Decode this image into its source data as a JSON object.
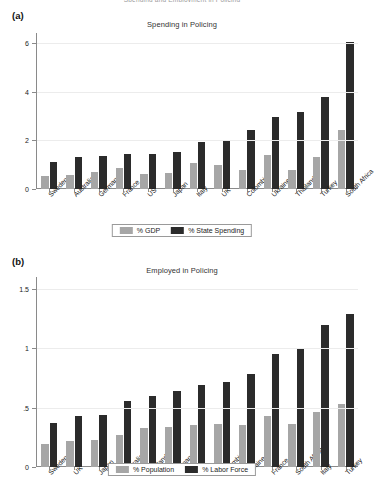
{
  "running_title": "Spending and Employment in Policing",
  "panels": [
    {
      "letter": "(a)",
      "title": "Spending in Policing",
      "legend": [
        {
          "label": "% GDP",
          "style": "light"
        },
        {
          "label": "% State Spending",
          "style": "dark"
        }
      ]
    },
    {
      "letter": "(b)",
      "title": "Employed in Policing",
      "legend": [
        {
          "label": "% Population",
          "style": "light"
        },
        {
          "label": "% Labor Force",
          "style": "dark"
        }
      ]
    }
  ],
  "colors": {
    "light_bar": "#a6a6a6",
    "dark_bar": "#2b2b2b",
    "axis": "#8a8a8a",
    "grid": "#ececec"
  },
  "chart_data": [
    {
      "type": "bar",
      "panel": "(a)",
      "title": "Spending in Policing",
      "xlabel": "",
      "ylabel": "",
      "ylim": [
        0,
        6.4
      ],
      "yticks": [
        0,
        2,
        4,
        6
      ],
      "ytick_labels": [
        "0",
        "2",
        "4",
        "6"
      ],
      "grid": true,
      "legend_position": "bottom",
      "categories": [
        "Sweden",
        "Australia",
        "Germany",
        "France",
        "US",
        "Japan",
        "Italy",
        "UK",
        "Colombia",
        "Ukraine",
        "Thailand",
        "Turkey",
        "South Africa"
      ],
      "series": [
        {
          "name": "% GDP",
          "values": [
            0.55,
            0.56,
            0.68,
            0.87,
            0.62,
            0.67,
            1.08,
            0.98,
            0.78,
            1.39,
            0.77,
            1.3,
            2.42
          ]
        },
        {
          "name": "% State Spending",
          "values": [
            1.11,
            1.32,
            1.37,
            1.43,
            1.44,
            1.5,
            1.93,
            2.0,
            2.42,
            2.97,
            3.17,
            3.79,
            6.02
          ]
        }
      ]
    },
    {
      "type": "bar",
      "panel": "(b)",
      "title": "Employed in Policing",
      "xlabel": "",
      "ylabel": "",
      "ylim": [
        0,
        1.6
      ],
      "yticks": [
        0,
        0.5,
        1,
        1.5
      ],
      "ytick_labels": [
        "0",
        ".5",
        "1",
        "1.5"
      ],
      "grid": true,
      "legend_position": "bottom",
      "categories": [
        "Sweden",
        "UK",
        "Japan",
        "Australia",
        "Thailand",
        "Germany",
        "US",
        "Colombia",
        "Ukraine",
        "France",
        "South Africa",
        "Italy",
        "Turkey"
      ],
      "series": [
        {
          "name": "% Population",
          "values": [
            0.19,
            0.22,
            0.23,
            0.27,
            0.33,
            0.34,
            0.35,
            0.36,
            0.355,
            0.43,
            0.36,
            0.46,
            0.53
          ]
        },
        {
          "name": "% Labor Force",
          "values": [
            0.37,
            0.43,
            0.44,
            0.56,
            0.6,
            0.64,
            0.69,
            0.72,
            0.78,
            0.95,
            0.99,
            1.2,
            1.29
          ]
        }
      ]
    }
  ]
}
